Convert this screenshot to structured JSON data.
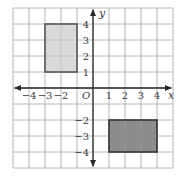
{
  "diagram": {
    "type": "coordinate-grid",
    "grid": {
      "x_min": -5,
      "x_max": 5,
      "y_min": -5,
      "y_max": 5,
      "origin_px": [
        93,
        88
      ],
      "unit_px": 16,
      "line_color": "#b8b8b8",
      "axis_color": "#2a2a2a"
    },
    "axes": {
      "x_label": "x",
      "y_label": "y",
      "origin_label": "O"
    },
    "x_ticks": [
      {
        "value": -4,
        "label": "−4"
      },
      {
        "value": -3,
        "label": "−3"
      },
      {
        "value": -2,
        "label": "−2"
      },
      {
        "value": 1,
        "label": "1"
      },
      {
        "value": 2,
        "label": "2"
      },
      {
        "value": 3,
        "label": "3"
      },
      {
        "value": 4,
        "label": "4"
      }
    ],
    "y_ticks": [
      {
        "value": 4,
        "label": "4"
      },
      {
        "value": 3,
        "label": "3"
      },
      {
        "value": 2,
        "label": "2"
      },
      {
        "value": 1,
        "label": "1"
      },
      {
        "value": -2,
        "label": "−2"
      },
      {
        "value": -3,
        "label": "−3"
      },
      {
        "value": -4,
        "label": "−4"
      }
    ],
    "shapes": [
      {
        "name": "light-rectangle",
        "x1": -3,
        "y1": 1,
        "x2": -1,
        "y2": 4,
        "fill": "#d9d9d9",
        "stroke": "#555555"
      },
      {
        "name": "dark-rectangle",
        "x1": 1,
        "y1": -4,
        "x2": 4,
        "y2": -2,
        "fill": "#8c8c8c",
        "stroke": "#333333"
      }
    ]
  }
}
